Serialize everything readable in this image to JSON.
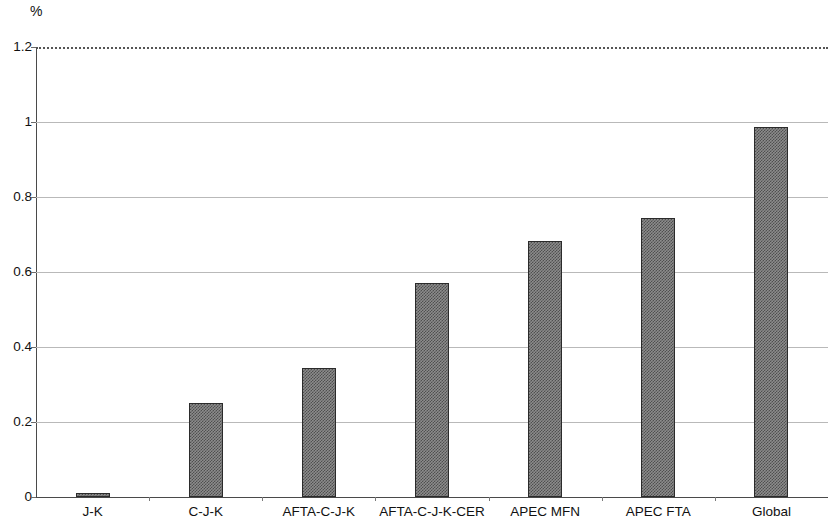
{
  "unit_label": "%",
  "chart_data": {
    "type": "bar",
    "title": "",
    "subtitle": "",
    "xlabel": "",
    "ylabel": "%",
    "ylim": [
      0,
      1.2
    ],
    "ytick_labels": [
      "0",
      "0.2",
      "0.4",
      "0.6",
      "0.8",
      "1",
      "1.2"
    ],
    "ytick_values": [
      0,
      0.2,
      0.4,
      0.6,
      0.8,
      1.0,
      1.2
    ],
    "grid": true,
    "grid_axis": "y",
    "legend": false,
    "legend_position": "none",
    "bar_fill": "#8c8c8c",
    "bar_pattern": "checkerboard-crosshatch",
    "bar_edge_color": "#2b2b2b",
    "categories": [
      "J-K",
      "C-J-K",
      "AFTA-C-J-K",
      "AFTA-C-J-K-CER",
      "APEC MFN",
      "APEC FTA",
      "Global"
    ],
    "values": [
      0.012,
      0.25,
      0.344,
      0.572,
      0.684,
      0.744,
      0.986
    ]
  }
}
